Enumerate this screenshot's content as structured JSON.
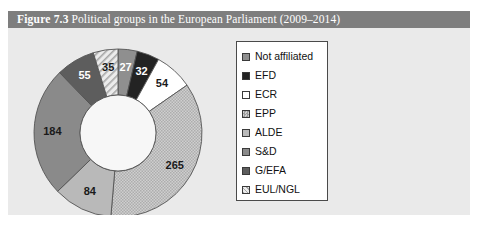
{
  "figure": {
    "label": "Figure 7.3",
    "title": "Political groups in the European Parliament (2009–2014)",
    "panel_bg": "#eaeaea",
    "title_bar_bg": "#7e7e7e",
    "title_bar_fg": "#ffffff"
  },
  "legend": {
    "box_bg": "#ffffff",
    "box_border": "#4a4a4a",
    "items": [
      {
        "label": "Not affiliated",
        "color": "#8f8f8f",
        "pattern": "solid"
      },
      {
        "label": "EFD",
        "color": "#232323",
        "pattern": "solid"
      },
      {
        "label": "ECR",
        "color": "#ffffff",
        "pattern": "solid"
      },
      {
        "label": "EPP",
        "color": "#c3c3c3",
        "pattern": "checker"
      },
      {
        "label": "ALDE",
        "color": "#b9b9b9",
        "pattern": "solid"
      },
      {
        "label": "S&D",
        "color": "#8a8a8a",
        "pattern": "solid"
      },
      {
        "label": "G/EFA",
        "color": "#5d5d5d",
        "pattern": "solid"
      },
      {
        "label": "EUL/NGL",
        "color": "#e0e0e0",
        "pattern": "hatch"
      }
    ]
  },
  "chart_data": {
    "type": "pie",
    "variant": "donut",
    "title": "Political groups in the European Parliament (2009–2014)",
    "total": 736,
    "start_angle_deg": 0,
    "direction": "clockwise",
    "outer_radius": 84,
    "inner_radius": 38,
    "center": [
      110,
      105
    ],
    "legend_position": "right",
    "categories": [
      "Not affiliated",
      "EFD",
      "ECR",
      "EPP",
      "ALDE",
      "S&D",
      "G/EFA",
      "EUL/NGL"
    ],
    "values": [
      27,
      32,
      54,
      265,
      84,
      184,
      55,
      35
    ],
    "slices": [
      {
        "name": "Not affiliated",
        "value": 27,
        "color": "#8f8f8f",
        "pattern": "solid",
        "label_fill": "light"
      },
      {
        "name": "EFD",
        "value": 32,
        "color": "#232323",
        "pattern": "solid",
        "label_fill": "light"
      },
      {
        "name": "ECR",
        "value": 54,
        "color": "#ffffff",
        "pattern": "solid",
        "label_fill": "dark"
      },
      {
        "name": "EPP",
        "value": 265,
        "color": "#c3c3c3",
        "pattern": "checker",
        "label_fill": "dark"
      },
      {
        "name": "ALDE",
        "value": 84,
        "color": "#b9b9b9",
        "pattern": "solid",
        "label_fill": "dark"
      },
      {
        "name": "S&D",
        "value": 184,
        "color": "#8a8a8a",
        "pattern": "solid",
        "label_fill": "dark"
      },
      {
        "name": "G/EFA",
        "value": 55,
        "color": "#5d5d5d",
        "pattern": "solid",
        "label_fill": "light"
      },
      {
        "name": "EUL/NGL",
        "value": 35,
        "color": "#e0e0e0",
        "pattern": "hatch",
        "label_fill": "dark"
      }
    ],
    "stroke_color": "#555555",
    "hole_color": "#f7f7f7"
  }
}
